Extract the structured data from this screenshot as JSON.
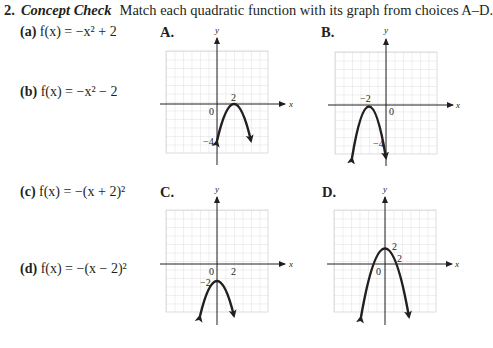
{
  "problem": {
    "number": "2.",
    "heading": "Concept Check",
    "instruction": "Match each quadratic function with its graph from choices A–D."
  },
  "functions": [
    {
      "label": "(a)",
      "expr": "f(x) = −x² + 2"
    },
    {
      "label": "(b)",
      "expr": "f(x) = −x² − 2"
    },
    {
      "label": "(c)",
      "expr": "f(x) = −(x + 2)²"
    },
    {
      "label": "(d)",
      "expr": "f(x) = −(x − 2)²"
    }
  ],
  "graphs": [
    {
      "label": "A.",
      "axis_x": "x",
      "axis_y": "y",
      "ticks": [
        "2",
        "0",
        "−4"
      ]
    },
    {
      "label": "B.",
      "axis_x": "x",
      "axis_y": "y",
      "ticks": [
        "−2",
        "0",
        "−4"
      ]
    },
    {
      "label": "C.",
      "axis_x": "x",
      "axis_y": "y",
      "ticks": [
        "0",
        "2",
        "−2"
      ]
    },
    {
      "label": "D.",
      "axis_x": "x",
      "axis_y": "y",
      "ticks": [
        "2",
        "2",
        "0"
      ]
    }
  ],
  "colors": {
    "ink": "#231f20",
    "grid": "#c8c8c8"
  }
}
